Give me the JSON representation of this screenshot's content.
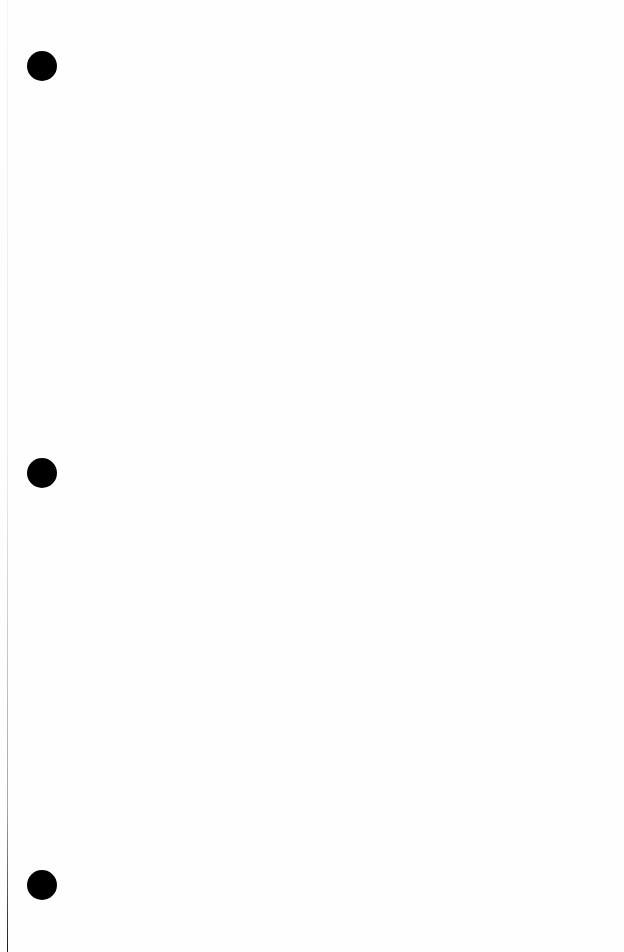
{
  "page": {
    "background": "#fefefe",
    "content": "",
    "binder_holes": [
      {
        "top": 51,
        "color": "#000000"
      },
      {
        "top": 458,
        "color": "#000000"
      },
      {
        "top": 870,
        "color": "#000000"
      }
    ]
  }
}
